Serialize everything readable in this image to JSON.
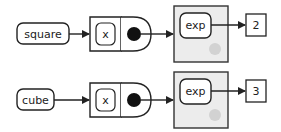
{
  "colors": {
    "stroke": "#222222",
    "panel_fill": "#ececec",
    "panel_dot": "#d2d2d2",
    "background": "#ffffff"
  },
  "rows": [
    {
      "input_label": "square",
      "param_label": "x",
      "inner_call_label": "exp",
      "output_value": "2"
    },
    {
      "input_label": "cube",
      "param_label": "x",
      "inner_call_label": "exp",
      "output_value": "3"
    }
  ]
}
